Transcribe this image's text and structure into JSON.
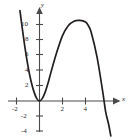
{
  "figure": {
    "background_color": "#ffffff",
    "curve_color": "#231f20",
    "axis_color": "#4a4a4a",
    "label_color": "#2b2b2b"
  },
  "axes": {
    "x_axis_label": "x",
    "y_axis_label": "y"
  },
  "chart_data": {
    "type": "line",
    "title": "",
    "xlabel": "x",
    "ylabel": "y",
    "grid": false,
    "legend": null,
    "xlim": [
      -2.6,
      6.6
    ],
    "ylim": [
      -5.0,
      12.0
    ],
    "x_ticks": [
      -2,
      2,
      4
    ],
    "x_tick_labels": [
      "-2",
      "2",
      "4"
    ],
    "y_ticks": [
      -4,
      -2,
      2,
      4,
      6,
      8,
      10
    ],
    "y_tick_labels": [
      "-4",
      "-2",
      "2",
      "4",
      "6",
      "8",
      "10"
    ],
    "series": [
      {
        "name": "curve",
        "description": "cubic with double root at origin, local maximum near x = 4, crossing x-axis near x = 5.5",
        "x": [
          -1.7,
          -1.5,
          -1.25,
          -1.0,
          -0.75,
          -0.5,
          -0.25,
          0.0,
          0.25,
          0.5,
          0.75,
          1.0,
          1.5,
          2.0,
          2.5,
          3.0,
          3.5,
          4.0,
          4.25,
          4.5,
          5.0,
          5.5,
          5.75,
          6.0,
          6.2
        ],
        "y": [
          11.9,
          9.6,
          6.9,
          4.6,
          2.7,
          1.3,
          0.35,
          0.0,
          0.35,
          1.2,
          2.4,
          3.8,
          6.4,
          8.6,
          9.9,
          10.5,
          10.6,
          10.4,
          9.9,
          9.0,
          5.8,
          1.2,
          -1.4,
          -3.0,
          -4.6
        ]
      }
    ]
  }
}
